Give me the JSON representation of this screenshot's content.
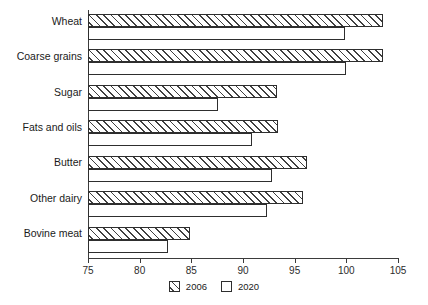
{
  "chart_data": {
    "type": "bar",
    "orientation": "horizontal",
    "title": "",
    "xlabel": "",
    "ylabel": "",
    "xlim": [
      75,
      105
    ],
    "xticks": [
      75,
      80,
      85,
      90,
      95,
      100,
      105
    ],
    "grid": false,
    "legend_position": "bottom-center",
    "categories": [
      "Wheat",
      "Coarse grains",
      "Sugar",
      "Fats and oils",
      "Butter",
      "Other dairy",
      "Bovine meat"
    ],
    "series": [
      {
        "name": "2006",
        "pattern": "diagonal-hatch",
        "values": [
          103.5,
          103.5,
          93.3,
          93.4,
          96.2,
          95.8,
          84.9
        ]
      },
      {
        "name": "2020",
        "pattern": "solid-white",
        "values": [
          99.9,
          100.0,
          87.6,
          90.9,
          92.8,
          92.3,
          82.7
        ]
      }
    ]
  },
  "legend": {
    "items": [
      {
        "label": "2006",
        "swatch": "hatched-square-icon"
      },
      {
        "label": "2020",
        "swatch": "empty-square-icon"
      }
    ]
  },
  "axis": {
    "tick_labels": [
      "75",
      "80",
      "85",
      "90",
      "95",
      "100",
      "105"
    ]
  }
}
